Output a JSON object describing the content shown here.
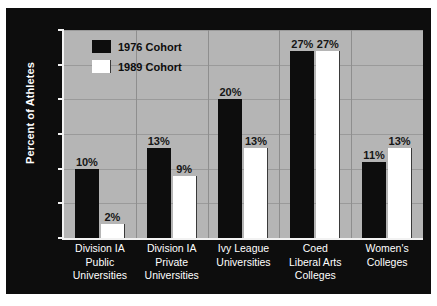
{
  "chart_data": {
    "type": "bar",
    "title": "",
    "xlabel": "",
    "ylabel": "Percent of Athletes",
    "ylim": [
      0,
      30
    ],
    "yticks": [
      0,
      5,
      10,
      15,
      20,
      25,
      30
    ],
    "ytick_labels": [
      "0",
      "5",
      "10",
      "15",
      "20",
      "25",
      "30"
    ],
    "grid": true,
    "legend_position": "upper-left-inside",
    "categories": [
      "Division IA Public Universities",
      "Division IA Private Universities",
      "Ivy League Universities",
      "Coed Liberal Arts Colleges",
      "Women's Colleges"
    ],
    "category_lines": [
      [
        "Division IA",
        "Public",
        "Universities"
      ],
      [
        "Division IA",
        "Private",
        "Universities"
      ],
      [
        "Ivy League",
        "Universities"
      ],
      [
        "Coed",
        "Liberal Arts",
        "Colleges"
      ],
      [
        "Women's",
        "Colleges"
      ]
    ],
    "series": [
      {
        "name": "1976 Cohort",
        "color": "#0d0d0d",
        "values": [
          10,
          13,
          20,
          27,
          11
        ],
        "labels": [
          "10%",
          "13%",
          "20%",
          "27%",
          "11%"
        ]
      },
      {
        "name": "1989 Cohort",
        "color": "#ffffff",
        "values": [
          2,
          9,
          13,
          27,
          13
        ],
        "labels": [
          "2%",
          "9%",
          "13%",
          "27%",
          "13%"
        ]
      }
    ]
  },
  "colors": {
    "figure_background": "#0d0d0d",
    "plot_background": "#b5b5b5",
    "gridline": "#9a9a9a",
    "axis": "#f2f2f2",
    "tick_text": "#ffffff",
    "category_text": "#ffffff",
    "value_text": "#161616",
    "legend_text": "#0d0d0d"
  }
}
